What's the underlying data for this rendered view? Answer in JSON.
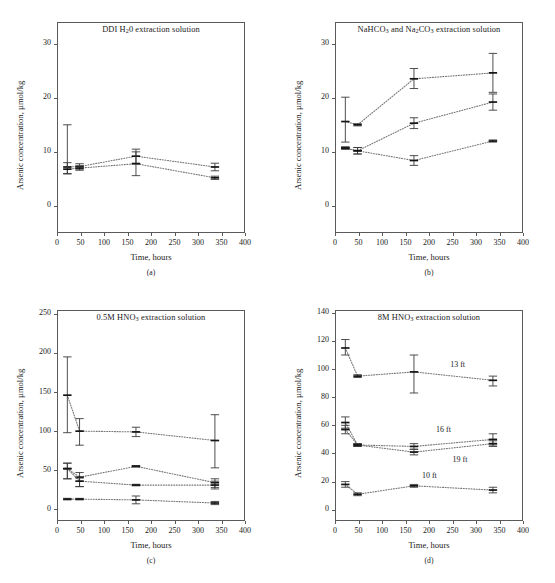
{
  "figure": {
    "caption": "",
    "axis_labels": {
      "x": "Time, hours",
      "y": "Arsenic concentration, µmol/kg"
    }
  },
  "panels": [
    {
      "id": "a",
      "label": "(a)",
      "title_parts": {
        "pre": "DDI H",
        "sub": "2",
        "post": "0 extraction solution"
      },
      "title_plain": "DDI H20 extraction solution",
      "chart_data": {
        "type": "line",
        "title": "DDI H20 extraction solution",
        "xlabel": "Time, hours",
        "ylabel": "Arsenic concentration, µmol/kg",
        "xlim": [
          0,
          400
        ],
        "ylim": [
          -5,
          34
        ],
        "xticks": [
          0,
          50,
          100,
          150,
          200,
          250,
          300,
          350,
          400
        ],
        "yticks": [
          0,
          10,
          20,
          30
        ],
        "grid": false,
        "legend": "none",
        "linestyle": "dotted",
        "marker": "errorbar",
        "x": [
          22,
          48,
          168,
          336
        ],
        "series": [
          {
            "name": "series-1",
            "values": [
              7.2,
              7.3,
              9.2,
              7.2
            ],
            "err_low": [
              1.2,
              0.5,
              1.3,
              0.7
            ],
            "err_high": [
              7.8,
              0.5,
              1.3,
              0.7
            ]
          },
          {
            "name": "series-2",
            "values": [
              6.8,
              7.0,
              7.8,
              5.2
            ],
            "err_low": [
              0.9,
              0.4,
              2.2,
              0.3
            ],
            "err_high": [
              1.2,
              0.4,
              2.2,
              0.3
            ]
          }
        ]
      }
    },
    {
      "id": "b",
      "label": "(b)",
      "title_parts": {
        "pre": "NaHCO",
        "sub": "3",
        "mid": " and Na",
        "sub2": "2",
        "mid2": "CO",
        "sub3": "3",
        "post": " extraction solution"
      },
      "title_plain": "NaHCO3 and Na2CO3 extraction solution",
      "chart_data": {
        "type": "line",
        "title": "NaHCO3 and Na2CO3 extraction solution",
        "xlabel": "Time, hours",
        "ylabel": "Arsenic concentration, µmol/kg",
        "xlim": [
          0,
          400
        ],
        "ylim": [
          -5,
          34
        ],
        "xticks": [
          0,
          50,
          100,
          150,
          200,
          250,
          300,
          350,
          400
        ],
        "yticks": [
          0,
          10,
          20,
          30
        ],
        "grid": false,
        "legend": "none",
        "linestyle": "dotted",
        "marker": "errorbar",
        "x": [
          22,
          48,
          168,
          336
        ],
        "series": [
          {
            "name": "series-1",
            "values": [
              15.6,
              15.0,
              23.5,
              24.6
            ],
            "err_low": [
              3.8,
              0.2,
              1.8,
              3.6
            ],
            "err_high": [
              4.5,
              0.2,
              1.9,
              3.6
            ]
          },
          {
            "name": "series-2",
            "values": [
              10.7,
              10.2,
              15.3,
              19.2
            ],
            "err_low": [
              0.2,
              0.6,
              1.0,
              1.5
            ],
            "err_high": [
              0.2,
              0.6,
              1.0,
              1.5
            ]
          },
          {
            "name": "series-3",
            "values": [
              10.7,
              10.2,
              8.4,
              12.0
            ],
            "err_low": [
              0.2,
              0.6,
              0.9,
              0.2
            ],
            "err_high": [
              0.2,
              0.6,
              0.9,
              0.2
            ]
          }
        ]
      }
    },
    {
      "id": "c",
      "label": "(c)",
      "title_parts": {
        "pre": "0.5M HNO",
        "sub": "3",
        "post": " extraction solution"
      },
      "title_plain": "0.5M HNO3 extraction solution",
      "chart_data": {
        "type": "line",
        "title": "0.5M HNO3 extraction solution",
        "xlabel": "Time, hours",
        "ylabel": "Arsenic concentration, µmol/kg",
        "xlim": [
          0,
          400
        ],
        "ylim": [
          -15,
          255
        ],
        "xticks": [
          0,
          50,
          100,
          150,
          200,
          250,
          300,
          350,
          400
        ],
        "yticks": [
          0,
          50,
          100,
          150,
          200,
          250
        ],
        "grid": false,
        "legend": "none",
        "linestyle": "dotted",
        "marker": "errorbar",
        "x": [
          22,
          48,
          168,
          336
        ],
        "series": [
          {
            "name": "series-1",
            "values": [
              146,
              100,
              99,
              88
            ],
            "err_low": [
              48,
              18,
              6,
              35
            ],
            "err_high": [
              49,
              16,
              6,
              33
            ]
          },
          {
            "name": "series-2",
            "values": [
              52,
              41,
              55,
              34
            ],
            "err_low": [
              13,
              12,
              1,
              6
            ],
            "err_high": [
              7,
              6,
              1,
              5
            ]
          },
          {
            "name": "series-3",
            "values": [
              52,
              36,
              31,
              31
            ],
            "err_low": [
              13,
              7,
              1,
              5
            ],
            "err_high": [
              7,
              4,
              1,
              5
            ]
          },
          {
            "name": "series-4",
            "values": [
              13,
              13,
              12,
              8
            ],
            "err_low": [
              1,
              1,
              5,
              2
            ],
            "err_high": [
              1,
              1,
              5,
              2
            ]
          }
        ]
      }
    },
    {
      "id": "d",
      "label": "(d)",
      "title_parts": {
        "pre": "8M HNO",
        "sub": "3",
        "post": " extraction solution"
      },
      "title_plain": "8M HNO3 extraction solution",
      "chart_data": {
        "type": "line",
        "title": "8M HNO3 extraction solution",
        "xlabel": "Time, hours",
        "ylabel": "Arsenic concentration, µmol/kg",
        "xlim": [
          0,
          400
        ],
        "ylim": [
          -8,
          142
        ],
        "xticks": [
          0,
          50,
          100,
          150,
          200,
          250,
          300,
          350,
          400
        ],
        "yticks": [
          0,
          20,
          40,
          60,
          80,
          100,
          120,
          140
        ],
        "grid": false,
        "legend": "inline-annotations",
        "linestyle": "dotted",
        "marker": "errorbar",
        "x": [
          22,
          48,
          168,
          336
        ],
        "series": [
          {
            "name": "13 ft",
            "values": [
              115,
              95,
              98,
              92
            ],
            "err_low": [
              5,
              1,
              15,
              4
            ],
            "err_high": [
              6,
              1,
              12,
              3
            ]
          },
          {
            "name": "16 ft",
            "values": [
              62,
              46,
              45,
              50
            ],
            "err_low": [
              4,
              1,
              2,
              4
            ],
            "err_high": [
              4,
              1,
              2,
              4
            ]
          },
          {
            "name": "19 ft",
            "values": [
              57,
              46,
              41,
              47
            ],
            "err_low": [
              3,
              1,
              2,
              2
            ],
            "err_high": [
              3,
              1,
              2,
              2
            ]
          },
          {
            "name": "10 ft",
            "values": [
              18,
              11,
              17,
              14
            ],
            "err_low": [
              2,
              1,
              1,
              2
            ],
            "err_high": [
              2,
              1,
              1,
              2
            ]
          }
        ],
        "annotations": [
          {
            "text": "13 ft",
            "x": 245,
            "y": 102
          },
          {
            "text": "16 ft",
            "x": 215,
            "y": 56
          },
          {
            "text": "19 ft",
            "x": 250,
            "y": 35
          },
          {
            "text": "10 ft",
            "x": 185,
            "y": 23
          }
        ]
      }
    }
  ]
}
